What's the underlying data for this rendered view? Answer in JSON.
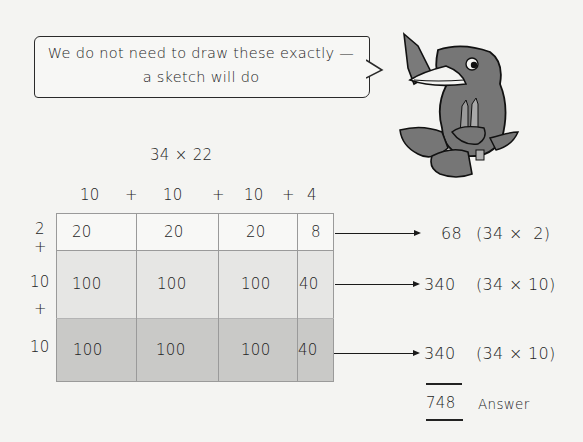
{
  "speech_bubble": {
    "line1": "We do not need to draw these exactly —",
    "line2": "a sketch will do"
  },
  "character": {
    "icon": "crow-holding-pencils-icon"
  },
  "problem": {
    "title": "34 × 22"
  },
  "column_header": {
    "parts": [
      "10",
      "+",
      "10",
      "+",
      "10",
      "+",
      "4"
    ]
  },
  "row_labels": [
    "2",
    "+",
    "10",
    "+",
    "10"
  ],
  "grid": {
    "rows": [
      {
        "cells": [
          "20",
          "20",
          "20",
          "8"
        ],
        "fill": "#f8f8f6"
      },
      {
        "cells": [
          "100",
          "100",
          "100",
          "40"
        ],
        "fill": "#e6e6e4"
      },
      {
        "cells": [
          "100",
          "100",
          "100",
          "40"
        ],
        "fill": "#c9c9c7"
      }
    ]
  },
  "results": [
    {
      "value": "68",
      "expr": "(34 ×  2)"
    },
    {
      "value": "340",
      "expr": "(34 × 10)"
    },
    {
      "value": "340",
      "expr": "(34 × 10)"
    }
  ],
  "answer": {
    "value": "748",
    "label": "Answer"
  }
}
